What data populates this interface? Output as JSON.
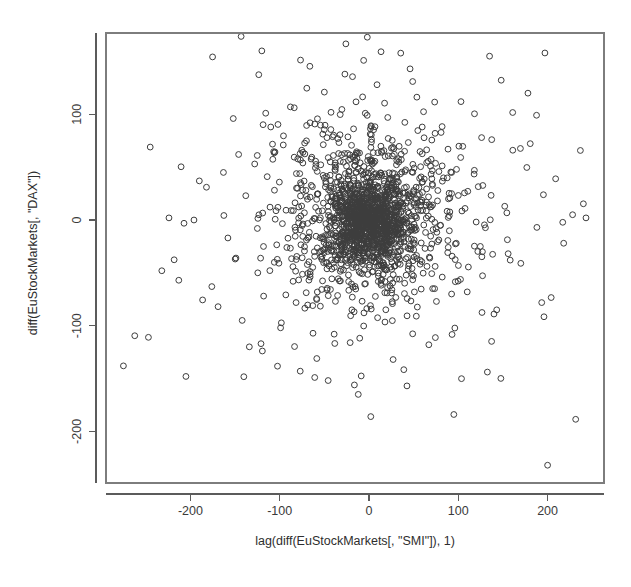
{
  "chart_data": {
    "type": "scatter",
    "title": "",
    "subtitle": "",
    "xlabel": "lag(diff(EuStockMarkets[, \"SMI\"]), 1)",
    "ylabel": "diff(EuStockMarkets[, \"DAX\"])",
    "xlim": [
      -285,
      250
    ],
    "ylim": [
      -245,
      175
    ],
    "xticks": [
      -200,
      -100,
      0,
      100,
      200
    ],
    "xtick_labels": [
      "-200",
      "-100",
      "0",
      "100",
      "200"
    ],
    "yticks": [
      100,
      0,
      -100,
      -200
    ],
    "ytick_labels": [
      "100",
      "0",
      "-100",
      "-200"
    ],
    "grid": false,
    "legend": null,
    "annotations": [],
    "marker": {
      "shape": "open-circle",
      "radius_px": 2.9,
      "stroke": "#3d3d3d",
      "fill": "none",
      "stroke_width": 1
    },
    "point_count": 1858,
    "core": {
      "center": [
        0,
        0
      ],
      "sigma_x": 33,
      "sigma_y": 29,
      "correlation": 0.0
    },
    "outliers": [
      [
        -275,
        -138
      ],
      [
        -247,
        -111
      ],
      [
        -245,
        69
      ],
      [
        -232,
        -48
      ],
      [
        -224,
        2
      ],
      [
        -213,
        -57
      ],
      [
        -205,
        -148
      ],
      [
        -196,
        0
      ],
      [
        -190,
        37
      ],
      [
        -182,
        31
      ],
      [
        -176,
        -63
      ],
      [
        -169,
        -82
      ],
      [
        -163,
        45
      ],
      [
        -158,
        -17
      ],
      [
        -152,
        96
      ],
      [
        -149,
        -36
      ],
      [
        -146,
        62
      ],
      [
        -142,
        -95
      ],
      [
        -138,
        23
      ],
      [
        -134,
        -120
      ],
      [
        -128,
        53
      ],
      [
        -125,
        -8
      ],
      [
        -120,
        160
      ],
      [
        -118,
        -72
      ],
      [
        -114,
        41
      ],
      [
        -110,
        88
      ],
      [
        -106,
        -40
      ],
      [
        -102,
        12
      ],
      [
        -99,
        -102
      ],
      [
        -96,
        71
      ],
      [
        -92,
        -26
      ],
      [
        -88,
        107
      ],
      [
        -85,
        -58
      ],
      [
        -80,
        30
      ],
      [
        -77,
        -143
      ],
      [
        -74,
        64
      ],
      [
        -70,
        -19
      ],
      [
        -66,
        92
      ],
      [
        -63,
        -81
      ],
      [
        -58,
        46
      ],
      [
        -54,
        -35
      ],
      [
        -50,
        121
      ],
      [
        -47,
        -66
      ],
      [
        -43,
        18
      ],
      [
        -39,
        -108
      ],
      [
        -35,
        77
      ],
      [
        -31,
        -24
      ],
      [
        -27,
        138
      ],
      [
        -23,
        -52
      ],
      [
        -19,
        29
      ],
      [
        -12,
        -165
      ],
      [
        -6,
        151
      ],
      [
        2,
        -186
      ],
      [
        9,
        128
      ],
      [
        14,
        -43
      ],
      [
        21,
        97
      ],
      [
        27,
        -132
      ],
      [
        33,
        58
      ],
      [
        40,
        -25
      ],
      [
        46,
        143
      ],
      [
        53,
        -91
      ],
      [
        60,
        36
      ],
      [
        67,
        -118
      ],
      [
        74,
        82
      ],
      [
        82,
        -54
      ],
      [
        89,
        20
      ],
      [
        95,
        -184
      ],
      [
        103,
        112
      ],
      [
        110,
        -68
      ],
      [
        118,
        47
      ],
      [
        127,
        -30
      ],
      [
        135,
        155
      ],
      [
        143,
        -85
      ],
      [
        152,
        13
      ],
      [
        161,
        66
      ],
      [
        170,
        -41
      ],
      [
        178,
        120
      ],
      [
        188,
        -7
      ],
      [
        197,
        158
      ],
      [
        200,
        -232
      ],
      [
        209,
        39
      ],
      [
        218,
        -22
      ],
      [
        228,
        5
      ],
      [
        243,
        2
      ]
    ]
  },
  "geometry": {
    "plot_left": 106,
    "plot_right": 604,
    "plot_top": 33,
    "plot_bottom": 483,
    "x_zero_px": 369,
    "y_zero_px": 220,
    "px_per_x_unit": 0.893,
    "px_per_y_unit": 1.057
  },
  "colors": {
    "background": "#ffffff",
    "marker_stroke": "#3d3d3d",
    "axis": "#5b5b5b",
    "box": "#7d7d7d",
    "text": "#2e2e2e"
  }
}
